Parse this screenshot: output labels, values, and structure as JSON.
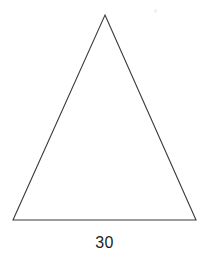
{
  "figure": {
    "kind": "triangle-diagram",
    "background_color": "#ffffff",
    "stroke_color": "#3b3b3b",
    "stroke_width": 1.1,
    "text_color": "#1e1e1e",
    "canvas": {
      "width": 209,
      "height": 262
    },
    "vertices": {
      "apex": {
        "x": 105,
        "y": 15
      },
      "bottom_left": {
        "x": 13,
        "y": 220
      },
      "bottom_right": {
        "x": 196,
        "y": 220
      }
    },
    "polygon_points": "105,15 196,220 13,220",
    "labels": {
      "base_length": "30",
      "base_label_x": 105,
      "base_label_y": 235
    },
    "artifacts": [
      {
        "x": 154,
        "y": 9,
        "w": 3,
        "h": 4
      }
    ]
  }
}
